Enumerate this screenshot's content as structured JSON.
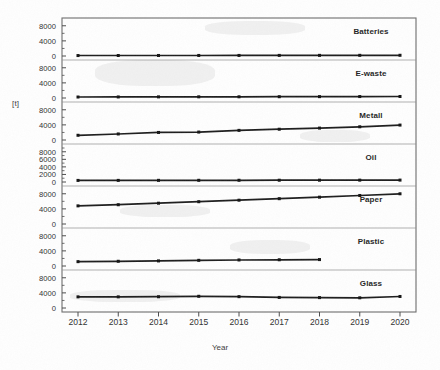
{
  "axes": {
    "y_axis_label": "[t]",
    "x_axis_label": "Year",
    "x_tick_labels": [
      "2012",
      "2013",
      "2014",
      "2015",
      "2016",
      "2017",
      "2018",
      "2019",
      "2020"
    ]
  },
  "panel_tick_labels": {
    "standard": [
      "0",
      "4000",
      "8000"
    ],
    "oil": [
      "0",
      "2000",
      "4000",
      "6000",
      "8000"
    ]
  },
  "style": {
    "line_color": "#1a1a1a",
    "frame_color": "#6b6b6b",
    "text_color": "#2e2e2e",
    "background": "#ffffff"
  },
  "chart_data": {
    "type": "line",
    "title": "",
    "subtitle": "",
    "xlabel": "Year",
    "ylabel": "[t]",
    "grid": false,
    "legend": "panel-labels-inside-right",
    "layout": "small-multiples, 7 vertically stacked panels sharing one x-axis",
    "x": [
      2012,
      2013,
      2014,
      2015,
      2016,
      2017,
      2018,
      2019,
      2020
    ],
    "panels": [
      {
        "label": "Batteries",
        "ylim": [
          0,
          9000
        ],
        "yticks": [
          0,
          4000,
          8000
        ],
        "values": [
          120,
          130,
          140,
          145,
          150,
          160,
          170,
          180,
          190
        ]
      },
      {
        "label": "E-waste",
        "ylim": [
          0,
          9000
        ],
        "yticks": [
          0,
          4000,
          8000
        ],
        "values": [
          260,
          280,
          300,
          310,
          320,
          340,
          360,
          380,
          400
        ]
      },
      {
        "label": "Metall",
        "ylim": [
          0,
          9000
        ],
        "yticks": [
          0,
          4000,
          8000
        ],
        "values": [
          1250,
          1600,
          2000,
          2100,
          2550,
          2850,
          3150,
          3500,
          3950
        ]
      },
      {
        "label": "Oil",
        "ylim": [
          0,
          9000
        ],
        "yticks": [
          0,
          2000,
          4000,
          6000,
          8000
        ],
        "values": [
          420,
          430,
          440,
          450,
          460,
          470,
          480,
          490,
          500
        ]
      },
      {
        "label": "Paper",
        "ylim": [
          0,
          9000
        ],
        "yticks": [
          0,
          4000,
          8000
        ],
        "values": [
          4800,
          5100,
          5500,
          5900,
          6300,
          6700,
          7100,
          7550,
          8000
        ]
      },
      {
        "label": "Plastic",
        "ylim": [
          0,
          9000
        ],
        "yticks": [
          0,
          4000,
          8000
        ],
        "values": [
          1150,
          1250,
          1350,
          1500,
          1600,
          1650,
          1700,
          null,
          null
        ]
      },
      {
        "label": "Glass",
        "ylim": [
          0,
          9000
        ],
        "yticks": [
          0,
          4000,
          8000
        ],
        "values": [
          2950,
          2950,
          2980,
          3100,
          3000,
          2800,
          2750,
          2700,
          3050
        ]
      }
    ]
  }
}
